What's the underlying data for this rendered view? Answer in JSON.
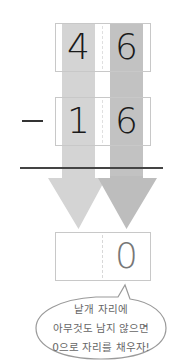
{
  "problem": {
    "operator": "−",
    "minuend": {
      "tens": "4",
      "ones": "6"
    },
    "subtrahend": {
      "tens": "1",
      "ones": "6"
    },
    "result": {
      "tens": "",
      "ones": "0"
    }
  },
  "bubble": {
    "lines": [
      "낱개 자리에",
      "아무것도 남지 않으면",
      "0으로 자리를 채우자!"
    ]
  },
  "colors": {
    "tens_band": "#d4d4d4",
    "ones_band": "#c2c2c2",
    "box_border": "#c8c8c8",
    "rule": "#444444"
  }
}
